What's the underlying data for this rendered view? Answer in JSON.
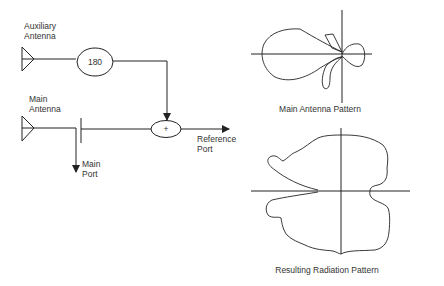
{
  "diagram": {
    "auxiliary_antenna": {
      "label_line1": "Auxiliary",
      "label_line2": "Antenna"
    },
    "phase_shifter": {
      "label": "180"
    },
    "main_antenna": {
      "label_line1": "Main",
      "label_line2": "Antenna"
    },
    "summer": {
      "label": "+"
    },
    "main_port": {
      "label_line1": "Main",
      "label_line2": "Port"
    },
    "reference_port": {
      "label_line1": "Reference",
      "label_line2": "Port"
    },
    "main_pattern": {
      "caption": "Main Antenna Pattern"
    },
    "resulting_pattern": {
      "caption": "Resulting Radiation Pattern"
    },
    "colors": {
      "stroke": "#222222",
      "text": "#333333",
      "background": "#ffffff"
    }
  }
}
